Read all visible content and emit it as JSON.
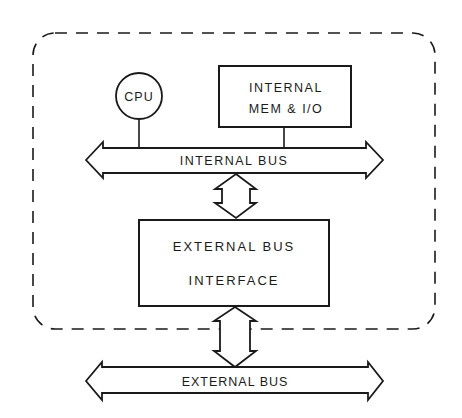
{
  "diagram": {
    "type": "block-diagram",
    "boundary": {
      "style": "dashed-rounded",
      "label": ""
    },
    "nodes": [
      {
        "id": "cpu",
        "label": "CPU",
        "shape": "circle"
      },
      {
        "id": "internal_mem_io",
        "label_line1": "INTERNAL",
        "label_line2": "MEM & I/O",
        "shape": "rectangle"
      },
      {
        "id": "internal_bus",
        "label": "INTERNAL BUS",
        "shape": "double-arrow-horizontal"
      },
      {
        "id": "external_bus_interface",
        "label_line1": "EXTERNAL BUS",
        "label_line2": "INTERFACE",
        "shape": "rectangle"
      },
      {
        "id": "external_bus",
        "label": "EXTERNAL BUS",
        "shape": "double-arrow-horizontal"
      }
    ],
    "edges": [
      {
        "from": "cpu",
        "to": "internal_bus",
        "style": "line"
      },
      {
        "from": "internal_mem_io",
        "to": "internal_bus",
        "style": "line"
      },
      {
        "from": "internal_bus",
        "to": "external_bus_interface",
        "style": "double-arrow-vertical"
      },
      {
        "from": "external_bus_interface",
        "to": "external_bus",
        "style": "double-arrow-vertical"
      }
    ],
    "colors": {
      "stroke": "#1a1a1a",
      "background": "#ffffff"
    }
  }
}
